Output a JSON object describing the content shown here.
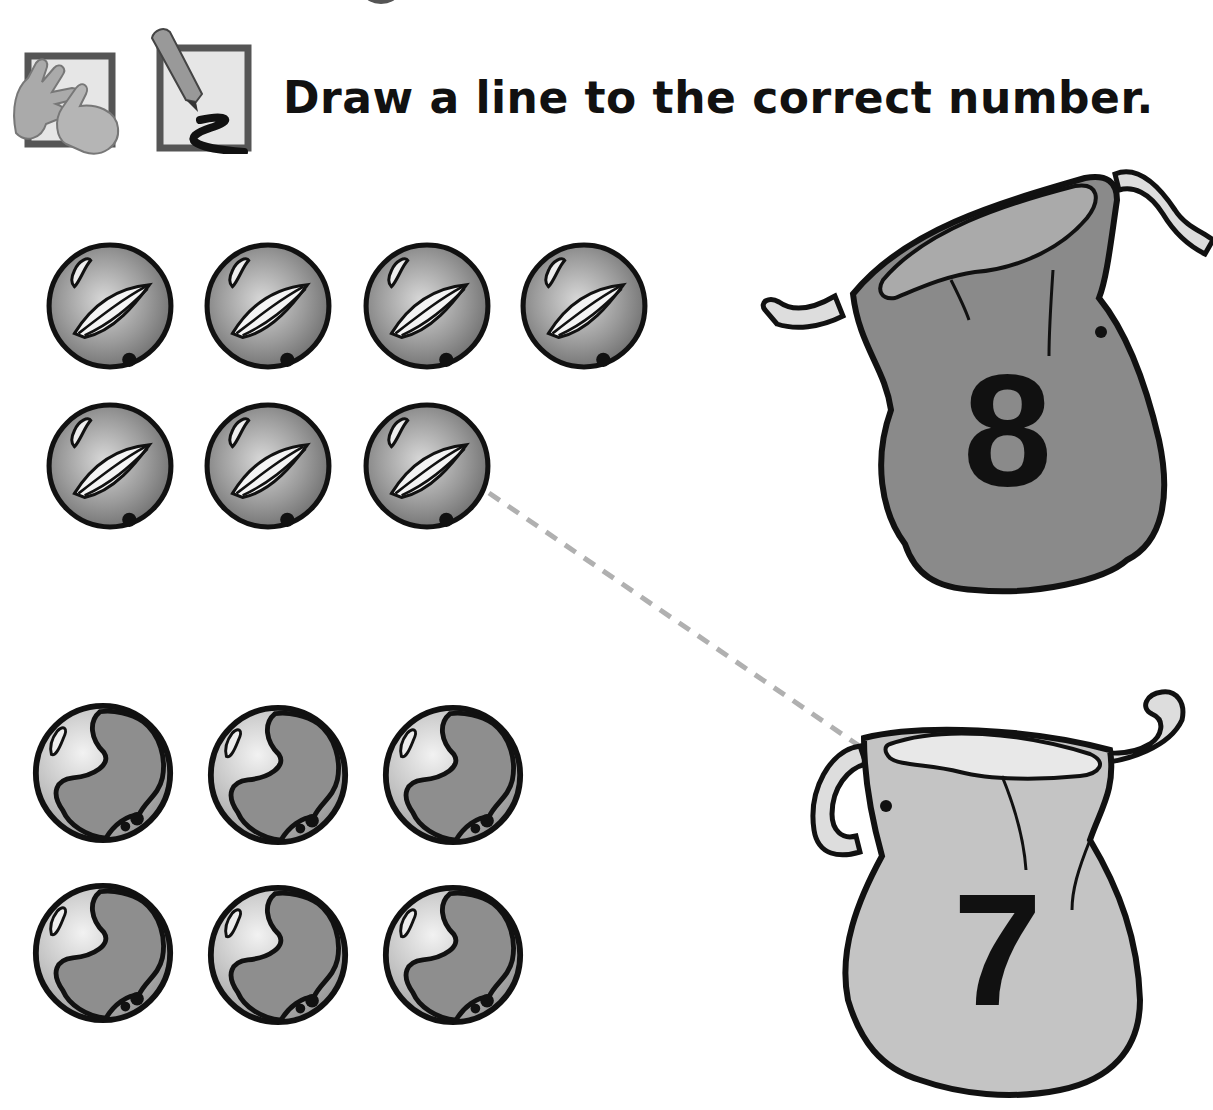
{
  "worksheet": {
    "instruction": "Draw a line to the correct number.",
    "icons": [
      "count-fingers-icon",
      "pencil-draw-icon"
    ]
  },
  "groups": [
    {
      "id": "leaf-marbles",
      "count": 7,
      "rows": [
        4,
        3
      ],
      "style": "leaf-swirl"
    },
    {
      "id": "globe-marbles",
      "count": 6,
      "rows": [
        3,
        3
      ],
      "style": "globe"
    }
  ],
  "bags": [
    {
      "id": "bag-8",
      "number": "8",
      "fill": "#8a8a8a"
    },
    {
      "id": "bag-7",
      "number": "7",
      "fill": "#c4c4c4"
    }
  ],
  "answer_line": {
    "from": "leaf-marbles",
    "to": "bag-7",
    "style": "dashed",
    "color": "#b0b0b0"
  }
}
